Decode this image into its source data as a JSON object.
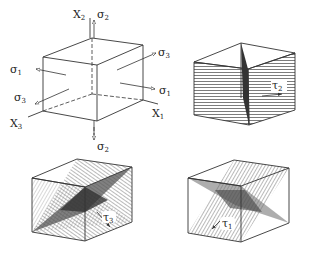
{
  "figure": {
    "panel_a": {
      "description": "Cube with principal stresses and axes",
      "axes": [
        {
          "name": "X",
          "sub": "2"
        },
        {
          "name": "X",
          "sub": "3"
        },
        {
          "name": "X",
          "sub": "1"
        }
      ],
      "stresses": [
        {
          "sym": "σ",
          "sub": "2",
          "position": "top"
        },
        {
          "sym": "σ",
          "sub": "2",
          "position": "bottom"
        },
        {
          "sym": "σ",
          "sub": "1",
          "position": "left"
        },
        {
          "sym": "σ",
          "sub": "1",
          "position": "right"
        },
        {
          "sym": "σ",
          "sub": "3",
          "position": "upper-right"
        },
        {
          "sym": "σ",
          "sub": "3",
          "position": "lower-left"
        }
      ]
    },
    "panel_b": {
      "description": "Cube with vertical shear plane",
      "shear": {
        "sym": "τ",
        "sub": "2"
      }
    },
    "panel_c": {
      "description": "Cube with two intersecting inclined shear planes",
      "shear": {
        "sym": "τ",
        "sub": "3"
      }
    },
    "panel_d": {
      "description": "Cube with two intersecting inclined shear planes",
      "shear": {
        "sym": "τ",
        "sub": "1"
      }
    }
  },
  "colors": {
    "line": "#333333",
    "hatch": "#444444",
    "dark_plane": "#555555",
    "background": "#ffffff"
  }
}
